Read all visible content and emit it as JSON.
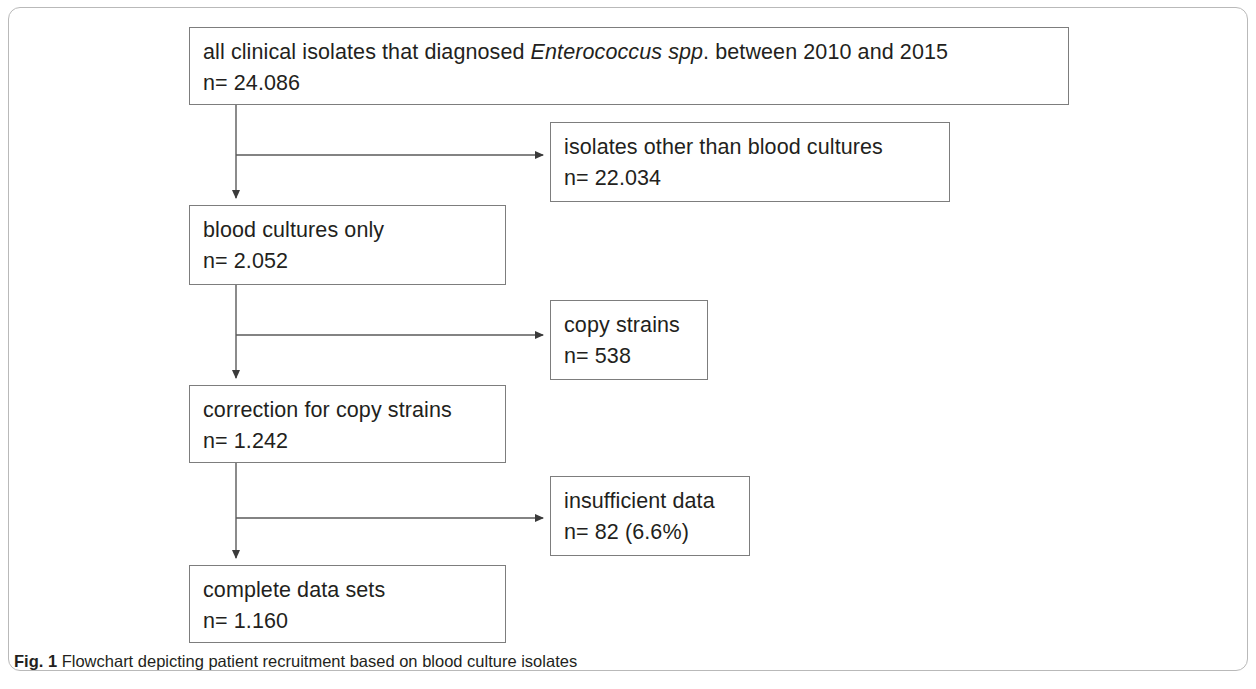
{
  "figure": {
    "caption_label": "Fig. 1",
    "caption_text": "Flowchart depicting patient recruitment based on blood culture isolates",
    "border_color": "#7d7d7d",
    "frame_color": "#b9b9b9",
    "text_color": "#231f20",
    "background": "#ffffff"
  },
  "flowchart": {
    "type": "flowchart",
    "orientation": "top-to-bottom with right-side exclusion branches",
    "main_path": [
      {
        "id": "all-isolates",
        "title_prefix": "all clinical isolates that diagnosed ",
        "title_italic": "Enterococcus spp",
        "title_suffix": ". between 2010 and 2015",
        "count_line": "n= 24.086",
        "n": 24086
      },
      {
        "id": "blood-only",
        "title": "blood cultures only",
        "count_line": "n= 2.052",
        "n": 2052
      },
      {
        "id": "correction",
        "title": "correction for copy strains",
        "count_line": "n= 1.242",
        "n": 1242
      },
      {
        "id": "complete",
        "title": "complete data sets",
        "count_line": "n= 1.160",
        "n": 1160
      }
    ],
    "exclusions": [
      {
        "id": "other-isolates",
        "title": "isolates other than blood cultures",
        "count_line": "n= 22.034",
        "n": 22034
      },
      {
        "id": "copy-strains",
        "title": "copy strains",
        "count_line": "n= 538",
        "n": 538
      },
      {
        "id": "insufficient",
        "title": "insufficient data",
        "count_line": "n= 82 (6.6%)",
        "n": 82,
        "percent": "6.6%"
      }
    ]
  }
}
